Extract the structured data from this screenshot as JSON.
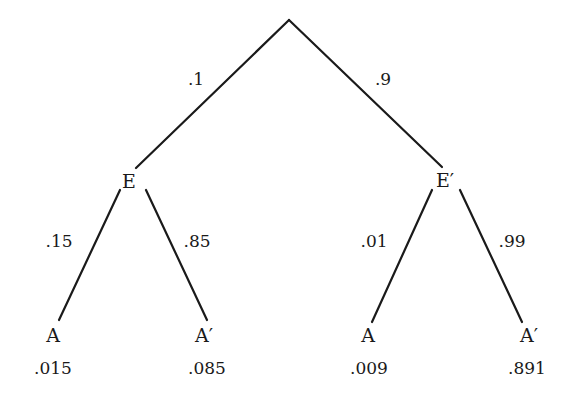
{
  "diagram": {
    "type": "probability-tree",
    "root": {
      "branches": [
        {
          "probability": ".1",
          "node": "E",
          "branches": [
            {
              "probability": ".15",
              "node": "A",
              "joint": ".015"
            },
            {
              "probability": ".85",
              "node": "A′",
              "joint": ".085"
            }
          ]
        },
        {
          "probability": ".9",
          "node": "E′",
          "branches": [
            {
              "probability": ".01",
              "node": "A",
              "joint": ".009"
            },
            {
              "probability": ".99",
              "node": "A′",
              "joint": ".891"
            }
          ]
        }
      ]
    },
    "line_color": "#1a1a1a"
  }
}
